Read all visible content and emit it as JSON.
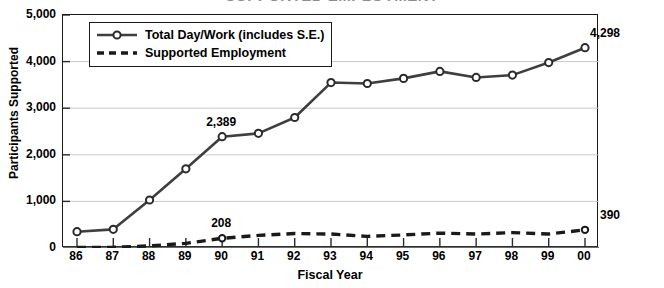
{
  "chart_data": {
    "type": "line",
    "title": "SUPPORTED EMPLOYMENT",
    "xlabel": "Fiscal Year",
    "ylabel": "Participants Supported",
    "categories": [
      "86",
      "87",
      "88",
      "89",
      "90",
      "91",
      "92",
      "93",
      "94",
      "95",
      "96",
      "97",
      "98",
      "99",
      "00"
    ],
    "ylim": [
      0,
      5000
    ],
    "ytick_values": [
      0,
      1000,
      2000,
      3000,
      4000,
      5000
    ],
    "ytick_labels": [
      "0",
      "1,000",
      "2,000",
      "3,000",
      "4,000",
      "5,000"
    ],
    "grid": true,
    "legend_position": "upper-left-inside",
    "series": [
      {
        "name": "Total Day/Work (includes S.E.)",
        "style": "solid",
        "marker": "open-circle",
        "color": "#3f3f3f",
        "values": [
          350,
          400,
          1030,
          1700,
          2389,
          2460,
          2800,
          3550,
          3530,
          3640,
          3790,
          3660,
          3710,
          3980,
          4298
        ]
      },
      {
        "name": "Supported Employment",
        "style": "dashed",
        "marker": "none",
        "color": "#1a1a1a",
        "values": [
          10,
          15,
          45,
          100,
          208,
          270,
          310,
          300,
          250,
          280,
          320,
          300,
          330,
          300,
          390
        ]
      }
    ],
    "annotations": [
      {
        "text": "2,389",
        "series": "Total Day/Work (includes S.E.)",
        "category": "90",
        "value": 2389
      },
      {
        "text": "4,298",
        "series": "Total Day/Work (includes S.E.)",
        "category": "00",
        "value": 4298
      },
      {
        "text": "208",
        "series": "Supported Employment",
        "category": "90",
        "value": 208
      },
      {
        "text": "390",
        "series": "Supported Employment",
        "category": "00",
        "value": 390
      }
    ]
  }
}
